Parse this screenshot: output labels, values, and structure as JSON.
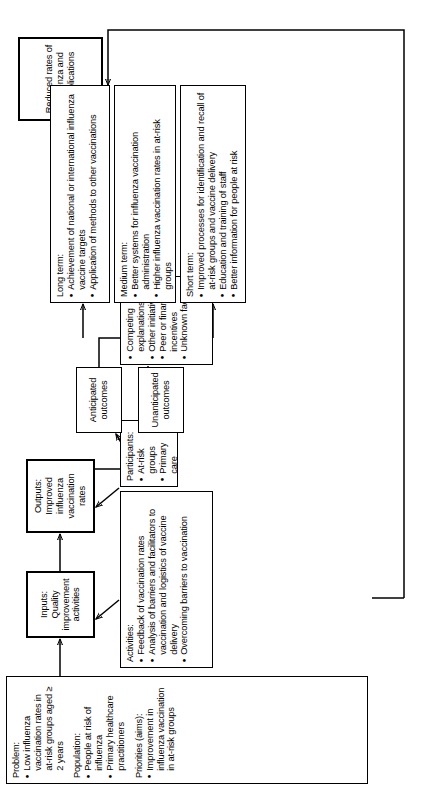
{
  "diagram": {
    "type": "logic-model-flowchart",
    "orientation": "rotated-90-ccw",
    "line_color": "#000000",
    "box_fill": "#ffffff",
    "nodes": {
      "context": {
        "name": "context-box",
        "sections": [
          {
            "heading": "Problem:",
            "items": [
              "Low influenza vaccination rates in at-risk groups aged ≥ 2 years"
            ]
          },
          {
            "heading": "Population:",
            "items": [
              "People at risk of influenza",
              "Primary healthcare practitioners"
            ]
          },
          {
            "heading": "Priorities (aims):",
            "items": [
              "Improvement in influenza vaccination in at-risk groups"
            ]
          }
        ]
      },
      "inputs": {
        "name": "inputs-box",
        "text": "Inputs: Quality improvement activities"
      },
      "outputs": {
        "name": "outputs-box",
        "text": "Outputs: Improved influenza vaccination rates"
      },
      "final_outcome": {
        "name": "final-outcome-box",
        "text": "Reduced rates of influenza and complications"
      },
      "activities": {
        "name": "activities-box",
        "heading": "Activities:",
        "items": [
          "Feedback of vaccination rates",
          "Analysis of barriers and facilitators to vaccination and logistics of vaccine delivery",
          "Overcoming barriers to vaccination"
        ]
      },
      "participants": {
        "name": "participants-box",
        "heading": "Participants:",
        "items": [
          "At-risk groups",
          "Primary care practitioners"
        ]
      },
      "competing": {
        "name": "competing-explanations-box",
        "heading": "",
        "items": [
          "Competing explanations",
          "Other initiatives",
          "Peer or financial incentives",
          "Unknown factors"
        ]
      },
      "anticipated": {
        "name": "anticipated-outcomes-box",
        "text": "Anticipated outcomes"
      },
      "unanticipated": {
        "name": "unanticipated-outcomes-box",
        "text": "Unanticipated outcomes"
      },
      "short_term": {
        "name": "short-term-box",
        "heading": "Short term:",
        "items": [
          "Improved processes for identification and recall of at-risk groups and vaccine delivery",
          "Education and training of staff",
          "Better information for people at risk"
        ]
      },
      "medium_term": {
        "name": "medium-term-box",
        "heading": "Medium term:",
        "items": [
          "Better systems for influenza vaccination administration",
          "Higher influenza vaccination rates in at-risk groups"
        ]
      },
      "long_term": {
        "name": "long-term-box",
        "heading": "Long term:",
        "items": [
          "Achievement of national or international influenza vaccine targets",
          "Application of methods to other vaccinations"
        ]
      }
    }
  }
}
